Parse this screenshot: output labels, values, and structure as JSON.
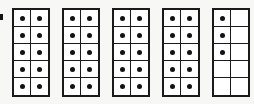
{
  "figure": {
    "name": "ten-frames-counting-figure",
    "background_color": "#f7f7f5",
    "frame_border_color": "#1a1a1a",
    "cell_fill_color": "#ffffff",
    "dot_color": "#121212",
    "total_dots": 43,
    "frame_count": 5,
    "rows_per_frame": 5,
    "columns_per_frame": 2,
    "cells_per_frame": 10
  },
  "chart_data": {
    "type": "table",
    "title": "",
    "xlabel": "",
    "ylabel": "",
    "categories": [
      "Frame 1",
      "Frame 2",
      "Frame 3",
      "Frame 4",
      "Frame 5"
    ],
    "values": [
      10,
      10,
      10,
      10,
      3
    ],
    "total": 43,
    "grid": true,
    "legend": "none"
  },
  "frames": [
    {
      "index": 1,
      "label": "ten-frame-1",
      "filled_count": 10,
      "cells": [
        [
          1,
          1
        ],
        [
          1,
          1
        ],
        [
          1,
          1
        ],
        [
          1,
          1
        ],
        [
          1,
          1
        ]
      ]
    },
    {
      "index": 2,
      "label": "ten-frame-2",
      "filled_count": 10,
      "cells": [
        [
          1,
          1
        ],
        [
          1,
          1
        ],
        [
          1,
          1
        ],
        [
          1,
          1
        ],
        [
          1,
          1
        ]
      ]
    },
    {
      "index": 3,
      "label": "ten-frame-3",
      "filled_count": 10,
      "cells": [
        [
          1,
          1
        ],
        [
          1,
          1
        ],
        [
          1,
          1
        ],
        [
          1,
          1
        ],
        [
          1,
          1
        ]
      ]
    },
    {
      "index": 4,
      "label": "ten-frame-4",
      "filled_count": 10,
      "cells": [
        [
          1,
          1
        ],
        [
          1,
          1
        ],
        [
          1,
          1
        ],
        [
          1,
          1
        ],
        [
          1,
          1
        ]
      ]
    },
    {
      "index": 5,
      "label": "ten-frame-5",
      "filled_count": 3,
      "cells": [
        [
          1,
          0
        ],
        [
          1,
          0
        ],
        [
          1,
          0
        ],
        [
          0,
          0
        ],
        [
          0,
          0
        ]
      ]
    }
  ]
}
